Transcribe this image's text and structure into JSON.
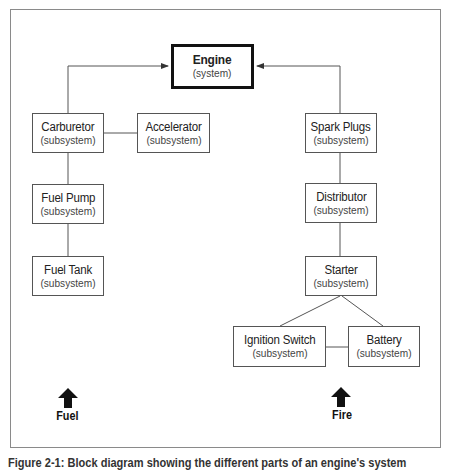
{
  "diagram": {
    "system": {
      "name": "Engine",
      "type": "(system)"
    },
    "subsystems": {
      "carburetor": {
        "name": "Carburetor",
        "type": "(subsystem)"
      },
      "accelerator": {
        "name": "Accelerator",
        "type": "(subsystem)"
      },
      "fuel_pump": {
        "name": "Fuel Pump",
        "type": "(subsystem)"
      },
      "fuel_tank": {
        "name": "Fuel Tank",
        "type": "(subsystem)"
      },
      "spark_plugs": {
        "name": "Spark Plugs",
        "type": "(subsystem)"
      },
      "distributor": {
        "name": "Distributor",
        "type": "(subsystem)"
      },
      "starter": {
        "name": "Starter",
        "type": "(subsystem)"
      },
      "ignition_switch": {
        "name": "Ignition Switch",
        "type": "(subsystem)"
      },
      "battery": {
        "name": "Battery",
        "type": "(subsystem)"
      }
    },
    "labels": {
      "fuel": "Fuel",
      "fire": "Fire"
    },
    "caption": "Figure 2-1: Block diagram showing the different parts of an engine's system"
  }
}
